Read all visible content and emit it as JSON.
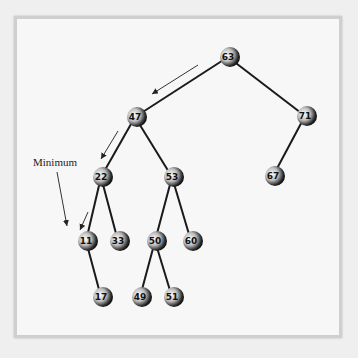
{
  "diagram": {
    "type": "binary-search-tree",
    "annotation": "Minimum",
    "nodes": [
      {
        "id": "n63",
        "value": "63",
        "x": 228,
        "y": 57
      },
      {
        "id": "n47",
        "value": "47",
        "x": 135,
        "y": 117
      },
      {
        "id": "n71",
        "value": "71",
        "x": 305,
        "y": 116
      },
      {
        "id": "n22",
        "value": "22",
        "x": 101,
        "y": 177
      },
      {
        "id": "n53",
        "value": "53",
        "x": 172,
        "y": 177
      },
      {
        "id": "n67",
        "value": "67",
        "x": 273,
        "y": 176
      },
      {
        "id": "n11",
        "value": "11",
        "x": 86,
        "y": 241
      },
      {
        "id": "n33",
        "value": "33",
        "x": 118,
        "y": 241
      },
      {
        "id": "n50",
        "value": "50",
        "x": 155,
        "y": 241
      },
      {
        "id": "n60",
        "value": "60",
        "x": 191,
        "y": 241
      },
      {
        "id": "n17",
        "value": "17",
        "x": 101,
        "y": 297
      },
      {
        "id": "n49",
        "value": "49",
        "x": 140,
        "y": 297
      },
      {
        "id": "n51",
        "value": "51",
        "x": 172,
        "y": 297
      }
    ],
    "edges": [
      [
        "63",
        "47"
      ],
      [
        "63",
        "71"
      ],
      [
        "47",
        "22"
      ],
      [
        "47",
        "53"
      ],
      [
        "71",
        "67"
      ],
      [
        "22",
        "11"
      ],
      [
        "22",
        "33"
      ],
      [
        "53",
        "50"
      ],
      [
        "53",
        "60"
      ],
      [
        "11",
        "17"
      ],
      [
        "50",
        "49"
      ],
      [
        "50",
        "51"
      ]
    ],
    "path_to_minimum": [
      "63",
      "47",
      "22",
      "11"
    ]
  }
}
